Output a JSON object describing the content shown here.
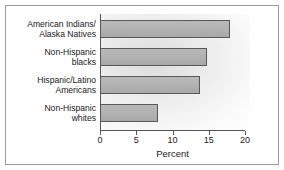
{
  "chart_data": {
    "type": "bar",
    "orientation": "horizontal",
    "title": "",
    "xlabel": "Percent",
    "ylabel": "",
    "xlim": [
      0,
      20
    ],
    "xticks": [
      0,
      5,
      10,
      15,
      20
    ],
    "xticklabels": [
      "0",
      "5",
      "10",
      "15",
      "20"
    ],
    "grid": false,
    "legend": false,
    "categories": [
      "American Indians/\nAlaska Natives",
      "Non-Hispanic\nblacks",
      "Hispanic/Latino\nAmericans",
      "Non-Hispanic\nwhites"
    ],
    "values": [
      17.9,
      14.7,
      13.8,
      8.0
    ],
    "bar_color": "#b2b2b2",
    "bar_edge_color": "#585858",
    "axis_color": "#555555",
    "background_color": "#ffffff",
    "frame_color": "#9a9a9a"
  },
  "axis": {
    "x_label": "Percent"
  }
}
